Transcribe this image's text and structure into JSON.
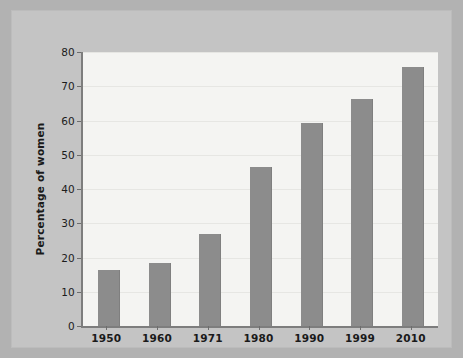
{
  "chart_data": {
    "type": "bar",
    "title": "",
    "xlabel": "",
    "ylabel": "Percentage of women",
    "categories": [
      "1950",
      "1960",
      "1971",
      "1980",
      "1990",
      "1999",
      "2010"
    ],
    "values": [
      16.5,
      18.3,
      27.0,
      46.5,
      59.3,
      66.2,
      75.6
    ],
    "ylim": [
      0,
      80
    ],
    "ytick_labels": [
      "0",
      "10",
      "20",
      "30",
      "40",
      "50",
      "60",
      "70",
      "80"
    ],
    "ytick_values": [
      0,
      10,
      20,
      30,
      40,
      50,
      60,
      70,
      80
    ],
    "grid": true,
    "legend": "none",
    "bar_color": "#8c8c8c",
    "plot_background": "#f4f4f2",
    "figure_background": "#c4c4c4",
    "axis_color": "#7d7d7d"
  }
}
